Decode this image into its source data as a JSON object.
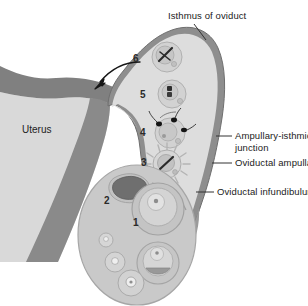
{
  "figure": {
    "background_color": "#ffffff",
    "width": 308,
    "height": 306
  },
  "colors": {
    "oviduct_wall": "#8e8e8e",
    "oviduct_lumen": "#dcdcdc",
    "uterus_body": "#d8d8d8",
    "uterus_wall": "#808080",
    "ovary_fill": "#c9c9c9",
    "ovary_outline": "#9a9a9a",
    "corpus_luteum": "#6f6f6f",
    "follicle_fill": "#d6d6d6",
    "text": "#1b1b1b",
    "leader_line": "#333333"
  },
  "labels": {
    "isthmus": "Isthmus of oviduct",
    "uterus": "Uterus",
    "ampullary_isthmic_line1": "Ampullary-isthmic",
    "ampullary_isthmic_line2": "junction",
    "ampulla": "Oviductal ampulla",
    "infundibulum": "Oviductal infundibulum"
  },
  "stage_numbers": {
    "one": "1",
    "two": "2",
    "three": "3",
    "four": "4",
    "five": "5",
    "six": "6"
  },
  "structures": {
    "uterus_name": "uterus",
    "oviduct_name": "oviduct",
    "ovary_name": "ovary",
    "arrow_name": "transport-direction-arrow"
  }
}
